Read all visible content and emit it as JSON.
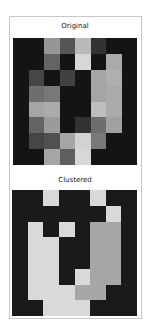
{
  "chart_data": [
    {
      "type": "heatmap",
      "title": "Original",
      "colormap": "gray",
      "rows": 8,
      "cols": 8,
      "values": [
        [
          20,
          20,
          150,
          85,
          185,
          50,
          20,
          20
        ],
        [
          20,
          20,
          100,
          20,
          215,
          20,
          170,
          20
        ],
        [
          20,
          70,
          20,
          65,
          20,
          165,
          175,
          20
        ],
        [
          20,
          110,
          120,
          20,
          20,
          165,
          170,
          20
        ],
        [
          20,
          165,
          170,
          20,
          20,
          190,
          170,
          20
        ],
        [
          20,
          100,
          155,
          20,
          50,
          110,
          160,
          20
        ],
        [
          20,
          70,
          80,
          165,
          210,
          120,
          20,
          20
        ],
        [
          20,
          20,
          165,
          95,
          215,
          20,
          20,
          20
        ]
      ],
      "xlabel": "",
      "ylabel": "",
      "grid": false
    },
    {
      "type": "heatmap",
      "title": "Clustered",
      "colormap": "gray",
      "rows": 8,
      "cols": 8,
      "cluster_colors": {
        "0": "#1a1a1a",
        "1": "#d9d9d9",
        "2": "#a6a6a6"
      },
      "values": [
        [
          0,
          0,
          1,
          0,
          0,
          1,
          0,
          0
        ],
        [
          0,
          0,
          0,
          0,
          0,
          0,
          1,
          0
        ],
        [
          0,
          1,
          0,
          1,
          0,
          2,
          2,
          0
        ],
        [
          0,
          1,
          1,
          0,
          0,
          2,
          2,
          0
        ],
        [
          0,
          1,
          1,
          0,
          0,
          2,
          2,
          0
        ],
        [
          0,
          1,
          1,
          0,
          1,
          2,
          2,
          0
        ],
        [
          0,
          1,
          1,
          1,
          2,
          2,
          0,
          0
        ],
        [
          0,
          0,
          1,
          1,
          1,
          0,
          0,
          0
        ]
      ],
      "xlabel": "",
      "ylabel": "",
      "grid": false
    }
  ],
  "panels": {
    "original_title": "Original",
    "clustered_title": "Clustered"
  }
}
